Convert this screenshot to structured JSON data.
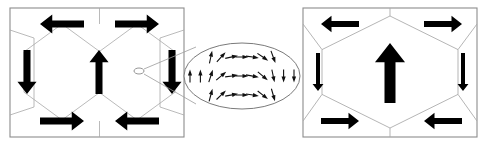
{
  "figure": {
    "background": "#ffffff",
    "panel_border_color": "#8c8c8c",
    "lattice_line_color": "#a8a8a8",
    "arrow_color": "#000000",
    "vector_arrow_color": "#111111",
    "ellipse_stroke": "#7a7a7a",
    "leader_line_color": "#9a9a9a"
  },
  "left_panel": {
    "name": "left-lattice-panel",
    "x": 10,
    "y": 8,
    "width": 174,
    "height": 129,
    "description": "Two hexagonal cells side by side with six bold arrows forming flux-closure pattern",
    "arrows": [
      {
        "id": "top-left",
        "dir": "left",
        "cx": 62,
        "cy": 24,
        "len": 44,
        "thick": 7
      },
      {
        "id": "top-right",
        "dir": "right",
        "cx": 137,
        "cy": 24,
        "len": 44,
        "thick": 7
      },
      {
        "id": "mid-left",
        "dir": "down",
        "cx": 27,
        "cy": 72,
        "len": 44,
        "thick": 7
      },
      {
        "id": "mid-center",
        "dir": "up",
        "cx": 99,
        "cy": 72,
        "len": 44,
        "thick": 7
      },
      {
        "id": "mid-right",
        "dir": "down",
        "cx": 172,
        "cy": 72,
        "len": 44,
        "thick": 7
      },
      {
        "id": "bot-left",
        "dir": "right",
        "cx": 62,
        "cy": 121,
        "len": 44,
        "thick": 7
      },
      {
        "id": "bot-right",
        "dir": "left",
        "cx": 137,
        "cy": 121,
        "len": 44,
        "thick": 7
      }
    ],
    "hex_cells": [
      {
        "id": "hex-a",
        "cx": 62,
        "cy": 72,
        "rx": 38,
        "ry": 48
      },
      {
        "id": "hex-b",
        "cx": 137,
        "cy": 72,
        "rx": 38,
        "ry": 48
      }
    ],
    "source_marker": {
      "cx": 139,
      "cy": 71,
      "rx": 5,
      "ry": 3
    }
  },
  "inset": {
    "name": "magnified-vector-field",
    "cx": 242,
    "cy": 76,
    "rx": 58,
    "ry": 33,
    "grid_cols": 11,
    "grid_rows": 3,
    "description": "Magnified view of the domain wall showing a continuous rotation of magnetisation vectors from up on the left, through horizontal in the middle, to up/down on the right",
    "leader_lines": [
      {
        "from_x": 144,
        "from_y": 69,
        "to_x": 196,
        "to_y": 47
      },
      {
        "from_x": 144,
        "from_y": 74,
        "to_x": 196,
        "to_y": 104
      }
    ],
    "vector_angles_deg": [
      [
        -90,
        -90,
        -78,
        -48,
        -12,
        0,
        8,
        34,
        70,
        90,
        90
      ],
      [
        -90,
        -90,
        -72,
        -40,
        -8,
        0,
        10,
        40,
        78,
        90,
        90
      ],
      [
        -90,
        -90,
        -75,
        -44,
        -10,
        0,
        9,
        38,
        74,
        90,
        90
      ]
    ]
  },
  "right_panel": {
    "name": "right-lattice-panel",
    "x": 303,
    "y": 8,
    "width": 174,
    "height": 129,
    "description": "Single large hexagonal cell with six bold arrows and one large central arrow",
    "hex_cell": {
      "cx": 390,
      "cy": 72,
      "rx": 68,
      "ry": 56
    },
    "arrows": [
      {
        "id": "top-left",
        "dir": "left",
        "cx": 340,
        "cy": 24,
        "len": 38,
        "thick": 6
      },
      {
        "id": "top-right",
        "dir": "right",
        "cx": 443,
        "cy": 24,
        "len": 38,
        "thick": 6
      },
      {
        "id": "mid-left",
        "dir": "down",
        "cx": 318,
        "cy": 72,
        "len": 38,
        "thick": 4
      },
      {
        "id": "center-big",
        "dir": "up",
        "cx": 390,
        "cy": 73,
        "len": 60,
        "thick": 11
      },
      {
        "id": "mid-right",
        "dir": "down",
        "cx": 463,
        "cy": 72,
        "len": 38,
        "thick": 4
      },
      {
        "id": "bot-left",
        "dir": "right",
        "cx": 340,
        "cy": 121,
        "len": 38,
        "thick": 6
      },
      {
        "id": "bot-right",
        "dir": "left",
        "cx": 443,
        "cy": 121,
        "len": 38,
        "thick": 6
      }
    ]
  }
}
